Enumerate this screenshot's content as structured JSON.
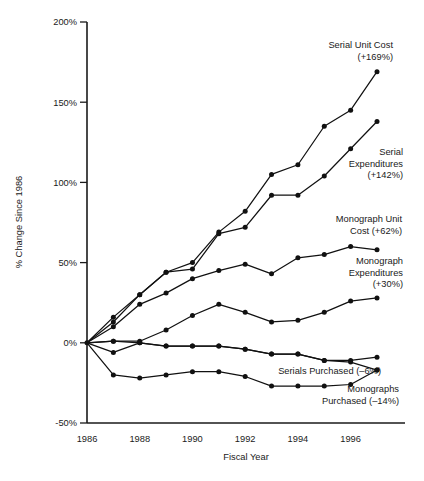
{
  "chart_data": {
    "type": "line",
    "title": "",
    "xlabel": "Fiscal Year",
    "ylabel": "% Change Since 1986",
    "x": [
      1986,
      1987,
      1988,
      1989,
      1990,
      1991,
      1992,
      1993,
      1994,
      1995,
      1996,
      1997
    ],
    "xlim": [
      1986,
      1997
    ],
    "ylim": [
      -50,
      200
    ],
    "ytick_labels": [
      "200%",
      "150%",
      "100%",
      "50%",
      "0%",
      "-50%"
    ],
    "ytick_values": [
      200,
      150,
      100,
      50,
      0,
      -50
    ],
    "xtick_labels": [
      "1986",
      "1988",
      "1990",
      "1992",
      "1994",
      "1996"
    ],
    "xtick_values": [
      1986,
      1988,
      1990,
      1992,
      1994,
      1996
    ],
    "grid": false,
    "legend_position": "inline-annotations",
    "series": [
      {
        "name": "Serial Unit Cost",
        "label": "Serial Unit Cost",
        "change_label": "(+169%)",
        "values": [
          0,
          16,
          30,
          44,
          50,
          69,
          82,
          105,
          111,
          135,
          145,
          169
        ]
      },
      {
        "name": "Serial Expenditures",
        "label": "Serial",
        "label2": "Expenditures",
        "change_label": "(+142%)",
        "values": [
          0,
          13,
          30,
          44,
          46,
          68,
          72,
          92,
          92,
          104,
          121,
          138
        ]
      },
      {
        "name": "Monograph Unit Cost",
        "label": "Monograph Unit",
        "label2": "Cost (+62%)",
        "change_label": "(+62%)",
        "values": [
          0,
          10,
          24,
          31,
          40,
          45,
          49,
          43,
          53,
          55,
          60,
          58
        ]
      },
      {
        "name": "Monograph Expenditures",
        "label": "Monograph",
        "label2": "Expenditures",
        "change_label": "(+30%)",
        "values": [
          0,
          1,
          1,
          8,
          17,
          24,
          19,
          13,
          14,
          19,
          26,
          28
        ]
      },
      {
        "name": "Serials Purchased",
        "label": "Serials Purchased (–6%)",
        "change_label": "(–6%)",
        "values": [
          0,
          1,
          0,
          -2,
          -2,
          -2,
          -4,
          -7,
          -7,
          -11,
          -11,
          -9
        ]
      },
      {
        "name": "Monographs Purchased",
        "label": "Monographs",
        "label2": "Purchased (–14%)",
        "change_label": "(–14%)",
        "values": [
          0,
          -6,
          0,
          -2,
          -2,
          -2,
          -4,
          -7,
          -7,
          -11,
          -12,
          -17
        ]
      },
      {
        "name": "Monographs Purchased Lower",
        "label": "",
        "change_label": "",
        "values": [
          0,
          -20,
          -22,
          -20,
          -18,
          -18,
          -21,
          -27,
          -27,
          -27,
          -26,
          -17
        ]
      }
    ],
    "annotations": [
      {
        "id": "serial-unit-cost",
        "text": "Serial Unit Cost",
        "text2": "(+169%)",
        "x": 393,
        "y": 48,
        "anchor": "end"
      },
      {
        "id": "serial-expenditures",
        "text": "Serial",
        "text2": "Expenditures",
        "text3": "(+142%)",
        "x": 403,
        "y": 155,
        "anchor": "end"
      },
      {
        "id": "monograph-unit-cost",
        "text": "Monograph Unit",
        "text2": "Cost (+62%)",
        "x": 402,
        "y": 222,
        "anchor": "end"
      },
      {
        "id": "monograph-expenditures",
        "text": "Monograph",
        "text2": "Expenditures",
        "text3": "(+30%)",
        "x": 403,
        "y": 264,
        "anchor": "end"
      },
      {
        "id": "serials-purchased",
        "text": "Serials Purchased (–6%)",
        "x": 381,
        "y": 374,
        "anchor": "end"
      },
      {
        "id": "monographs-purchased",
        "text": "Monographs",
        "text2": "Purchased (–14%)",
        "x": 399,
        "y": 392,
        "anchor": "end"
      }
    ]
  },
  "colors": {
    "ink": "#111111",
    "background": "#ffffff"
  }
}
